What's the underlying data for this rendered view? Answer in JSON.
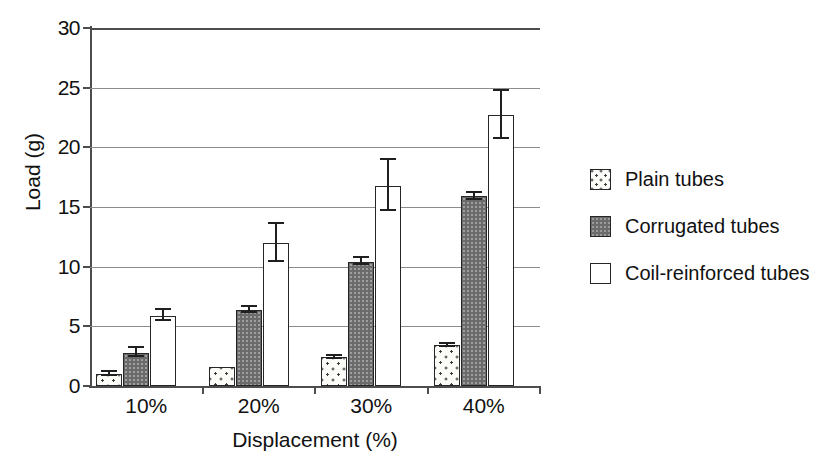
{
  "chart_data": {
    "type": "bar",
    "title": "",
    "xlabel": "Displacement (%)",
    "ylabel": "Load (g)",
    "categories": [
      "10%",
      "20%",
      "30%",
      "40%"
    ],
    "ylim": [
      0,
      30
    ],
    "yticks": [
      0,
      5,
      10,
      15,
      20,
      25,
      30
    ],
    "ytick_labels": [
      "0",
      "5",
      "10",
      "15",
      "20",
      "25",
      "30"
    ],
    "grid": "horizontal",
    "legend_position": "right",
    "series": [
      {
        "name": "Plain tubes",
        "fill": "dotted",
        "values": [
          1.0,
          1.6,
          2.4,
          3.4
        ],
        "errors": [
          0.15,
          0.0,
          0.15,
          0.15
        ]
      },
      {
        "name": "Corrugated tubes",
        "fill": "dark-gray",
        "values": [
          2.8,
          6.4,
          10.4,
          15.9
        ],
        "errors": [
          0.35,
          0.25,
          0.3,
          0.3
        ]
      },
      {
        "name": "Coil-reinforced tubes",
        "fill": "white",
        "values": [
          5.9,
          12.0,
          16.8,
          22.7
        ],
        "errors": [
          0.45,
          1.6,
          2.1,
          2.0
        ]
      }
    ]
  },
  "legend": {
    "items": [
      {
        "label": "Plain tubes",
        "swatch": "plain"
      },
      {
        "label": "Corrugated tubes",
        "swatch": "corrugated"
      },
      {
        "label": "Coil-reinforced tubes",
        "swatch": "coil"
      }
    ]
  },
  "colors": {
    "plain_fill": "#fbfbf8",
    "corrugated_fill": "#6b6b6b",
    "coil_fill": "#ffffff",
    "outline": "#262626",
    "gridline": "#8c8c8c",
    "axis": "#4d4d4d",
    "text": "#111111",
    "background": "#ffffff"
  }
}
